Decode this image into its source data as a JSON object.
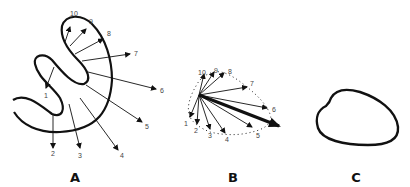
{
  "figure": {
    "panels": [
      {
        "id": "A",
        "label": "A",
        "description": "S-shaped outline with outward vectors numbered 1-10"
      },
      {
        "id": "B",
        "label": "B",
        "description": "Vectors 1-10 translated to common origin, dotted envelope, thick resultant arrow"
      },
      {
        "id": "C",
        "label": "C",
        "description": "Resulting closed outline"
      }
    ],
    "vector_labels": [
      "1",
      "2",
      "3",
      "4",
      "5",
      "6",
      "7",
      "8",
      "9",
      "10"
    ]
  }
}
